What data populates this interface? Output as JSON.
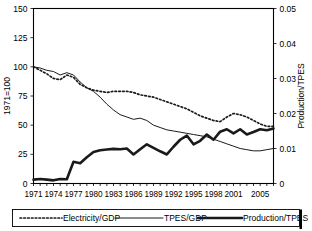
{
  "chart_data": {
    "type": "line",
    "title": "",
    "xlabel": "",
    "ylabel": "1971=100",
    "y2label": "Production/TPES",
    "grid": false,
    "legend_position": "bottom",
    "xlim": [
      1971,
      2007
    ],
    "ylim": [
      0,
      150
    ],
    "y2lim": [
      0,
      0.05
    ],
    "yticks": [
      "0",
      "25",
      "50",
      "75",
      "100",
      "125",
      "150"
    ],
    "ytick_values": [
      0,
      25,
      50,
      75,
      100,
      125,
      150
    ],
    "y2ticks": [
      "0",
      "0.01",
      "0.02",
      "0.03",
      "0.04",
      "0.05"
    ],
    "y2tick_values": [
      0,
      0.01,
      0.02,
      0.03,
      0.04,
      0.05
    ],
    "xticks": [
      "1971",
      "1974",
      "1977",
      "1980",
      "1983",
      "1986",
      "1989",
      "1992",
      "1995",
      "1998",
      "2001",
      "2005"
    ],
    "xtick_values": [
      1971,
      1974,
      1977,
      1980,
      1983,
      1986,
      1989,
      1992,
      1995,
      1998,
      2001,
      2005
    ],
    "x": [
      1971,
      1972,
      1973,
      1974,
      1975,
      1976,
      1977,
      1978,
      1979,
      1980,
      1981,
      1982,
      1983,
      1984,
      1985,
      1986,
      1987,
      1988,
      1989,
      1990,
      1991,
      1992,
      1993,
      1994,
      1995,
      1996,
      1997,
      1998,
      1999,
      2000,
      2001,
      2002,
      2003,
      2004,
      2005,
      2006,
      2007
    ],
    "series": [
      {
        "name": "Electricity/GDP",
        "style": "dotted",
        "axis": "left",
        "values": [
          100,
          97,
          94,
          90,
          89,
          93,
          91,
          85,
          82,
          80,
          79,
          78,
          79,
          79,
          79,
          78,
          76,
          75,
          74,
          72,
          70,
          68,
          66,
          64,
          61,
          58,
          56,
          54,
          53,
          57,
          60,
          59,
          57,
          54,
          51,
          49,
          49
        ]
      },
      {
        "name": "TPES/GDP",
        "style": "thin-solid",
        "axis": "left",
        "values": [
          100,
          99,
          97,
          96,
          93,
          95,
          93,
          87,
          82,
          79,
          74,
          68,
          63,
          59,
          57,
          55,
          56,
          54,
          50,
          48,
          46,
          45,
          44,
          43,
          42,
          41,
          40,
          38,
          36,
          34,
          32,
          30,
          29,
          28,
          28,
          29,
          30
        ]
      },
      {
        "name": "Production/TPES",
        "style": "thick-solid",
        "axis": "right",
        "values": [
          0.0011,
          0.0013,
          0.0011,
          0.0009,
          0.0013,
          0.0012,
          0.0062,
          0.0058,
          0.0075,
          0.009,
          0.0095,
          0.0097,
          0.0099,
          0.0098,
          0.01,
          0.0083,
          0.0098,
          0.0112,
          0.0102,
          0.0092,
          0.0083,
          0.0105,
          0.0125,
          0.0137,
          0.0112,
          0.0122,
          0.014,
          0.0125,
          0.0148,
          0.0155,
          0.0143,
          0.0155,
          0.014,
          0.0147,
          0.0155,
          0.0152,
          0.0157
        ]
      }
    ]
  },
  "legend": {
    "items": [
      {
        "label": "Electricity/GDP",
        "style": "dotted"
      },
      {
        "label": "TPES/GDP",
        "style": "thin-solid"
      },
      {
        "label": "Production/TPES",
        "style": "thick-solid"
      }
    ]
  }
}
